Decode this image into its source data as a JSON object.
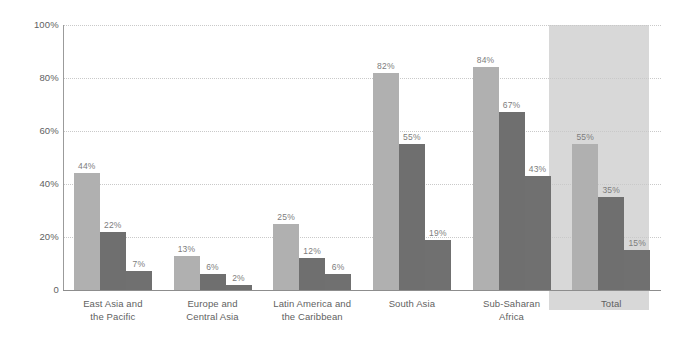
{
  "chart_data": {
    "type": "bar",
    "title": "",
    "subtitle": "",
    "xlabel": "",
    "ylabel": "",
    "ylim": [
      0,
      100
    ],
    "ytick_labels": [
      "100%",
      "80%",
      "60%",
      "40%",
      "20%",
      "0"
    ],
    "ytick_values": [
      100,
      80,
      60,
      40,
      20,
      0
    ],
    "grid": true,
    "legend": "none",
    "value_suffix": "%",
    "categories": [
      "East Asia and the Pacific",
      "Europe and Central Asia",
      "Latin America and the Caribbean",
      "South Asia",
      "Sub-Saharan Africa",
      "Total"
    ],
    "category_lines": [
      [
        "East Asia and",
        "the Pacific"
      ],
      [
        "Europe and",
        "Central Asia"
      ],
      [
        "Latin America and",
        "the Caribbean"
      ],
      [
        "South Asia"
      ],
      [
        "Sub-Saharan",
        "Africa"
      ],
      [
        "Total"
      ]
    ],
    "series": [
      {
        "name": "series-1",
        "color": "#b0b0b0",
        "values": [
          44,
          13,
          25,
          82,
          84,
          55
        ],
        "labels": [
          "44%",
          "13%",
          "25%",
          "82%",
          "84%",
          "55%"
        ]
      },
      {
        "name": "series-2",
        "color": "#6f6f6f",
        "values": [
          22,
          6,
          12,
          55,
          67,
          35
        ],
        "labels": [
          "22%",
          "6%",
          "12%",
          "55%",
          "67%",
          "35%"
        ]
      },
      {
        "name": "series-3",
        "color": "#707070",
        "values": [
          7,
          2,
          6,
          19,
          43,
          15
        ],
        "labels": [
          "7%",
          "2%",
          "6%",
          "19%",
          "43%",
          "15%"
        ]
      }
    ],
    "highlighted_category": "Total",
    "colors": {
      "highlight_band": "#d8d8d8",
      "gridline": "#c9c9c9",
      "axis": "#8d8d8d",
      "tick_text": "#616161",
      "value_label": "#7d7d7d",
      "category_text": "#5f5f5f",
      "background": "#ffffff"
    }
  }
}
